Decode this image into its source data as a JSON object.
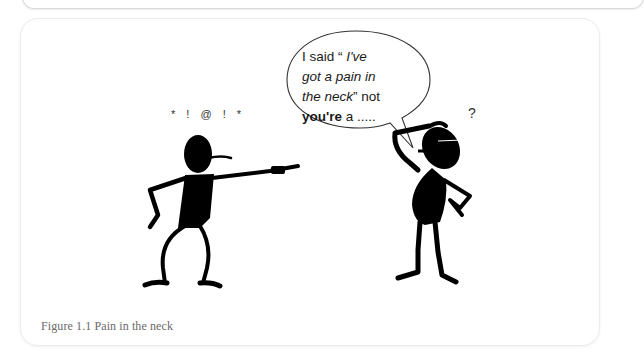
{
  "figure": {
    "caption": "Figure 1.1  Pain in the neck",
    "speech_bubble": {
      "line1_plain": "I said “ ",
      "line1_italic": "I've",
      "line2_italic": "got a pain in",
      "line3_italic": "the neck",
      "line3_plain": "” not",
      "line4_bold": "you're",
      "line4_plain": " a  ....."
    },
    "left_figure_expletive": "* ! @ ! *",
    "right_figure_symbol": "?"
  }
}
